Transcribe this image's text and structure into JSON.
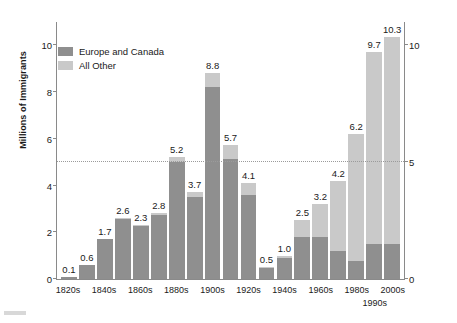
{
  "axis": {
    "y_title": "Millions of Immigrants",
    "left_ticks": [
      "0",
      "2",
      "4",
      "6",
      "8",
      "10"
    ],
    "right_ticks": [
      "0",
      "5",
      "10"
    ]
  },
  "legend": {
    "items": [
      {
        "label": "Europe and Canada",
        "color": "#8f8f8f"
      },
      {
        "label": "All Other",
        "color": "#c9c9c9"
      }
    ]
  },
  "chart_data": {
    "type": "bar",
    "title": "",
    "subtype": "stacked-vertical",
    "xlabel": "",
    "ylabel": "Millions of Immigrants",
    "ylim": [
      0,
      11
    ],
    "grid": false,
    "legend_position": "upper-left",
    "reference_line": {
      "value": 5,
      "style": "dotted",
      "color": "#9b9b9b"
    },
    "categories": [
      "1820s",
      "1830s",
      "1840s",
      "1850s",
      "1860s",
      "1870s",
      "1880s",
      "1890s",
      "1900s",
      "1910s",
      "1920s",
      "1930s",
      "1940s",
      "1950s",
      "1960s",
      "1970s",
      "1980s",
      "1990s",
      "2000s"
    ],
    "tick_labels": [
      "1820s",
      "",
      "1840s",
      "",
      "1860s",
      "",
      "1880s",
      "",
      "1900s",
      "",
      "1920s",
      "",
      "1940s",
      "",
      "1960s",
      "",
      "1980s",
      "1990s",
      "2000s"
    ],
    "totals": [
      0.1,
      0.6,
      1.7,
      2.6,
      2.3,
      2.8,
      5.2,
      3.7,
      8.8,
      5.7,
      4.1,
      0.5,
      1.0,
      2.5,
      3.2,
      4.2,
      6.2,
      9.7,
      10.3
    ],
    "data_labels": [
      "0.1",
      "0.6",
      "1.7",
      "2.6",
      "2.3",
      "2.8",
      "5.2",
      "3.7",
      "8.8",
      "5.7",
      "4.1",
      "0.5",
      "1.0",
      "2.5",
      "3.2",
      "4.2",
      "6.2",
      "9.7",
      "10.3"
    ],
    "series": [
      {
        "name": "Europe and Canada",
        "color": "#8f8f8f",
        "values": [
          0.1,
          0.6,
          1.7,
          2.55,
          2.25,
          2.75,
          5.0,
          3.5,
          8.2,
          5.1,
          3.6,
          0.45,
          0.9,
          1.8,
          1.8,
          1.2,
          0.75,
          1.5,
          1.5
        ]
      },
      {
        "name": "All Other",
        "color": "#c9c9c9",
        "values": [
          0.0,
          0.0,
          0.0,
          0.05,
          0.05,
          0.05,
          0.2,
          0.2,
          0.6,
          0.6,
          0.5,
          0.05,
          0.1,
          0.7,
          1.4,
          3.0,
          5.45,
          8.2,
          8.8
        ]
      }
    ]
  }
}
